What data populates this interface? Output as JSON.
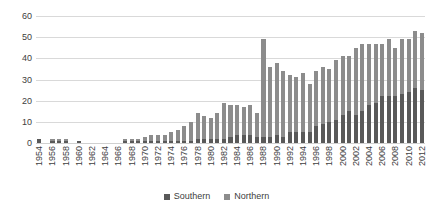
{
  "chart_data": {
    "type": "bar",
    "stacked": true,
    "title": "",
    "xlabel": "",
    "ylabel": "",
    "ylim": [
      0,
      60
    ],
    "yticks": [
      0,
      10,
      20,
      30,
      40,
      50,
      60
    ],
    "grid": true,
    "legend_position": "bottom-center",
    "categories": [
      "1954",
      "1955",
      "1956",
      "1957",
      "1958",
      "1959",
      "1960",
      "1961",
      "1962",
      "1963",
      "1964",
      "1965",
      "1966",
      "1967",
      "1968",
      "1969",
      "1970",
      "1971",
      "1972",
      "1973",
      "1974",
      "1975",
      "1976",
      "1977",
      "1978",
      "1979",
      "1980",
      "1981",
      "1982",
      "1983",
      "1984",
      "1985",
      "1986",
      "1987",
      "1988",
      "1989",
      "1990",
      "1991",
      "1992",
      "1993",
      "1994",
      "1995",
      "1996",
      "1997",
      "1998",
      "1999",
      "2000",
      "2001",
      "2002",
      "2003",
      "2004",
      "2005",
      "2006",
      "2007",
      "2008",
      "2009",
      "2010",
      "2011",
      "2012"
    ],
    "tick_label_every": 2,
    "series": [
      {
        "name": "Southern",
        "color": "#595959",
        "values": [
          2,
          0,
          1,
          1,
          1,
          0,
          1,
          0,
          0,
          0,
          0,
          0,
          0,
          1,
          1,
          1,
          1,
          1,
          1,
          1,
          1,
          1,
          1,
          1,
          2,
          2,
          2,
          2,
          2,
          3,
          4,
          4,
          4,
          3,
          3,
          3,
          4,
          3,
          5,
          5,
          5,
          5,
          8,
          9,
          10,
          11,
          13,
          15,
          13,
          15,
          18,
          19,
          22,
          22,
          22,
          23,
          24,
          26,
          25
        ]
      },
      {
        "name": "Northern",
        "color": "#8c8c8c",
        "values": [
          0,
          0,
          1,
          1,
          1,
          0,
          0,
          0,
          0,
          0,
          0,
          0,
          0,
          1,
          1,
          1,
          2,
          3,
          3,
          3,
          4,
          5,
          7,
          9,
          12,
          11,
          10,
          12,
          17,
          15,
          14,
          13,
          14,
          11,
          46,
          33,
          34,
          31,
          27,
          26,
          28,
          23,
          26,
          27,
          25,
          28,
          28,
          26,
          32,
          32,
          29,
          28,
          25,
          27,
          23,
          26,
          25,
          27,
          27
        ]
      }
    ],
    "totals": [
      2,
      0,
      2,
      2,
      2,
      0,
      1,
      0,
      0,
      0,
      0,
      0,
      0,
      2,
      2,
      2,
      3,
      4,
      4,
      4,
      5,
      6,
      8,
      10,
      14,
      13,
      12,
      14,
      19,
      18,
      18,
      17,
      18,
      14,
      49,
      36,
      38,
      34,
      32,
      31,
      33,
      28,
      34,
      36,
      35,
      39,
      41,
      41,
      45,
      47,
      47,
      47,
      47,
      49,
      45,
      49,
      49,
      53,
      52
    ]
  },
  "legend": {
    "items": [
      {
        "label": "Southern",
        "color": "#595959"
      },
      {
        "label": "Northern",
        "color": "#8c8c8c"
      }
    ]
  }
}
